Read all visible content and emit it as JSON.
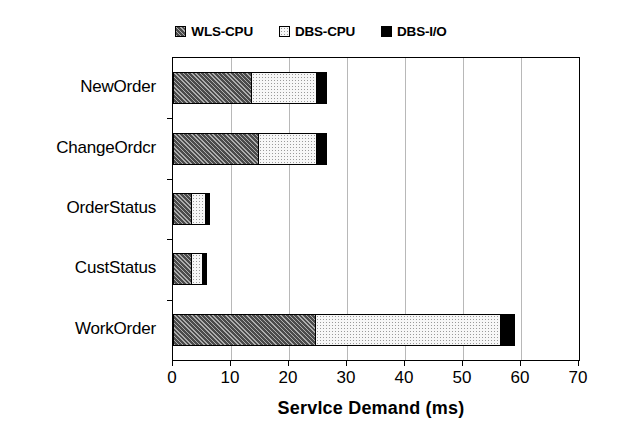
{
  "chart_data": {
    "type": "bar",
    "orientation": "horizontal",
    "stacked": true,
    "title": "",
    "xlabel": "Servlce Demand (ms)",
    "ylabel": "",
    "xlim": [
      0,
      70
    ],
    "xticks": [
      0,
      10,
      20,
      30,
      40,
      50,
      60,
      70
    ],
    "xtick_labels": [
      "0",
      "10",
      "20",
      "30",
      "40",
      "50",
      "60",
      "70"
    ],
    "grid": true,
    "grid_axis": "x",
    "legend_position": "top-center",
    "categories": [
      "NewOrder",
      "ChangeOrdcr",
      "OrderStatus",
      "CustStatus",
      "WorkOrder"
    ],
    "series": [
      {
        "name": "WLS-CPU",
        "color": "#4b4b4b",
        "pattern": "cross-hatch",
        "values": [
          13.3,
          14.5,
          3.0,
          3.0,
          24.3
        ]
      },
      {
        "name": "DBS-CPU",
        "color": "#f7f7f7",
        "pattern": "fine-dots",
        "values": [
          11.0,
          9.8,
          2.2,
          1.7,
          31.7
        ]
      },
      {
        "name": "DBS-I/O",
        "color": "#000000",
        "pattern": "solid",
        "values": [
          1.6,
          1.6,
          0.5,
          0.5,
          2.2
        ]
      }
    ],
    "totals": [
      25.9,
      25.9,
      5.7,
      5.2,
      58.2
    ]
  },
  "legend": {
    "entries": [
      {
        "label": "WLS-CPU"
      },
      {
        "label": "DBS-CPU"
      },
      {
        "label": "DBS-I/O"
      }
    ]
  },
  "axes": {
    "x_title": "Servlce Demand (ms)"
  }
}
